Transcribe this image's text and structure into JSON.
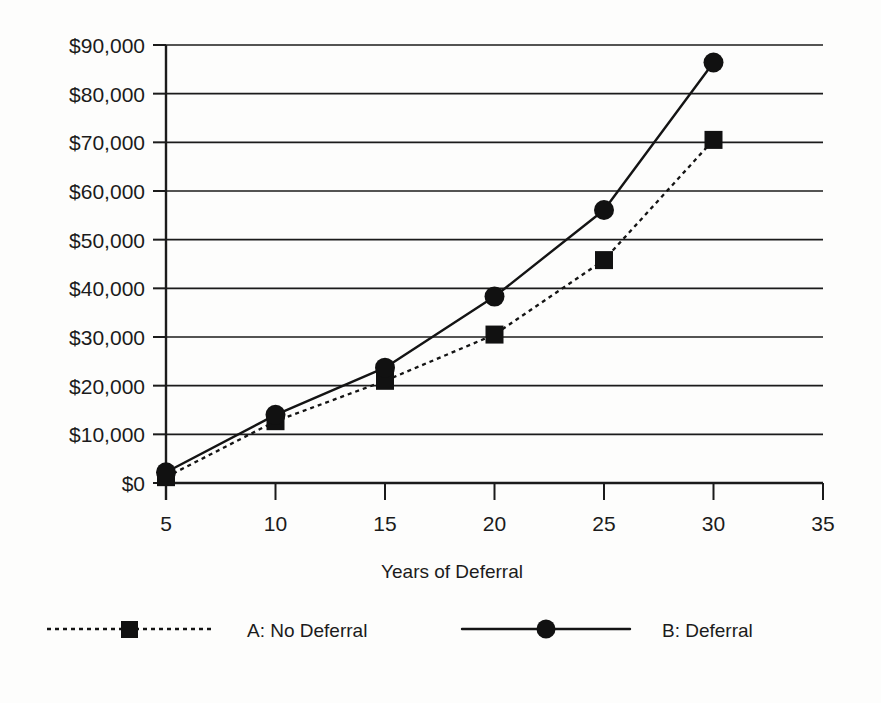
{
  "chart_data": {
    "type": "line",
    "title": "",
    "xlabel": "Years of Deferral",
    "ylabel": "",
    "x": [
      5,
      10,
      15,
      20,
      25,
      30
    ],
    "xlim": [
      5,
      35
    ],
    "ylim": [
      0,
      90000
    ],
    "grid": true,
    "legend_position": "bottom",
    "xticks": [
      "5",
      "10",
      "15",
      "20",
      "25",
      "30",
      "35"
    ],
    "xtick_values": [
      5,
      10,
      15,
      20,
      25,
      30,
      35
    ],
    "yticks": [
      "$0",
      "$10,000",
      "$20,000",
      "$30,000",
      "$40,000",
      "$50,000",
      "$60,000",
      "$70,000",
      "$80,000",
      "$90,000"
    ],
    "ytick_values": [
      0,
      10000,
      20000,
      30000,
      40000,
      50000,
      60000,
      70000,
      80000,
      90000
    ],
    "series": [
      {
        "name": "A: No Deferral",
        "marker": "square",
        "linestyle": "dashed",
        "color": "#141414",
        "values": [
          1200,
          12700,
          21000,
          30500,
          45800,
          70500
        ]
      },
      {
        "name": "B: Deferral",
        "marker": "circle",
        "linestyle": "solid",
        "color": "#141414",
        "values": [
          2200,
          14000,
          23700,
          38300,
          56100,
          86400
        ]
      }
    ]
  },
  "legend": {
    "entries": [
      {
        "label": "A: No Deferral",
        "marker": "square-marker-icon",
        "linestyle": "dashed"
      },
      {
        "label": "B: Deferral",
        "marker": "circle-marker-icon",
        "linestyle": "solid"
      }
    ]
  },
  "axes": {
    "x_title": "Years of Deferral"
  }
}
